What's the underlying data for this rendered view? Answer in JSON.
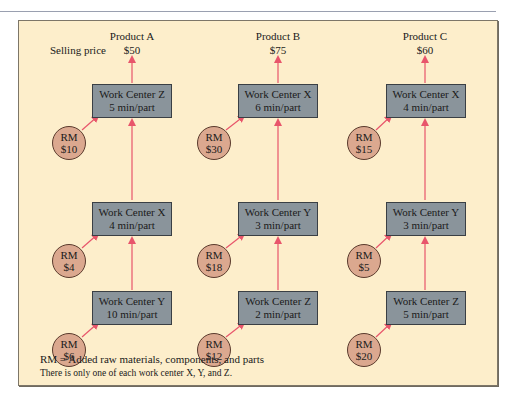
{
  "selling_price_label": "Selling price",
  "products": [
    {
      "name": "Product A",
      "price": "$50",
      "stations": [
        {
          "title": "Work Center Z",
          "time": "5 min/part",
          "rm_label": "RM",
          "rm_cost": "$10"
        },
        {
          "title": "Work Center X",
          "time": "4 min/part",
          "rm_label": "RM",
          "rm_cost": "$4"
        },
        {
          "title": "Work Center Y",
          "time": "10 min/part",
          "rm_label": "RM",
          "rm_cost": "$6"
        }
      ]
    },
    {
      "name": "Product B",
      "price": "$75",
      "stations": [
        {
          "title": "Work Center X",
          "time": "6 min/part",
          "rm_label": "RM",
          "rm_cost": "$30"
        },
        {
          "title": "Work Center Y",
          "time": "3 min/part",
          "rm_label": "RM",
          "rm_cost": "$18"
        },
        {
          "title": "Work Center Z",
          "time": "2 min/part",
          "rm_label": "RM",
          "rm_cost": "$12"
        }
      ]
    },
    {
      "name": "Product C",
      "price": "$60",
      "stations": [
        {
          "title": "Work Center X",
          "time": "4 min/part",
          "rm_label": "RM",
          "rm_cost": "$15"
        },
        {
          "title": "Work Center Y",
          "time": "3 min/part",
          "rm_label": "RM",
          "rm_cost": "$5"
        },
        {
          "title": "Work Center Z",
          "time": "5 min/part",
          "rm_label": "RM",
          "rm_cost": "$20"
        }
      ]
    }
  ],
  "legend": {
    "rm_definition": "RM = Added raw materials, components, and parts",
    "note": "There is only one of each work center X, Y, and Z."
  },
  "colors": {
    "panel_bg": "#fdeecb",
    "work_center_fill": "#8a949b",
    "rm_fill": "#dba88f",
    "arrow": "#e8556b"
  }
}
